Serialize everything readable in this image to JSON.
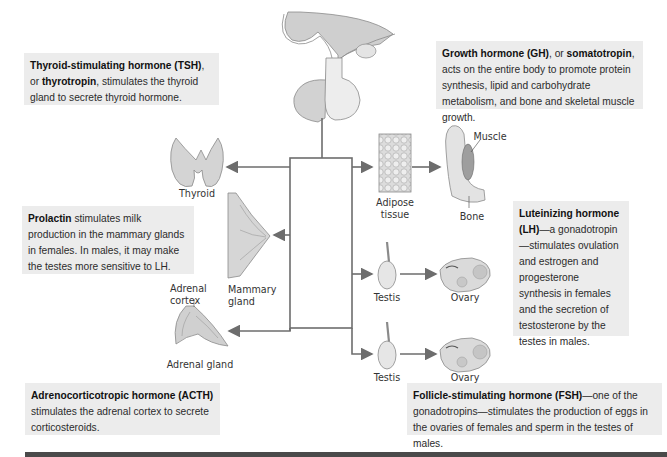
{
  "boxes": {
    "tsh": {
      "bold1": "Thyroid-stimulating hormone (TSH)",
      "text1": ", or ",
      "bold2": "thyrotropin",
      "text2": ", stimulates the thyroid gland to secrete thyroid hormone."
    },
    "gh": {
      "bold1": "Growth hormone (GH)",
      "text1": ", or ",
      "bold2": "somatotropin",
      "text2": ", acts on the entire body to promote protein synthesis, lipid and carbohydrate metabolism, and bone and skeletal muscle growth."
    },
    "prolactin": {
      "bold1": "Prolactin",
      "text1": " stimulates milk production in the mammary glands in females. In males, it may make the testes more sensitive to LH."
    },
    "lh": {
      "bold1": "Luteinizing hormone (LH)",
      "text1": "—a gonadotropin—stimulates ovulation and estrogen and progesterone synthesis in females and the secretion of testosterone by the testes in males."
    },
    "acth": {
      "bold1": "Adrenocorticotropic hormone (ACTH)",
      "text1": " stimulates the adrenal cortex to secrete corticosteroids."
    },
    "fsh": {
      "bold1": "Follicle-stimulating hormone (FSH)",
      "text1": "—one of the gonadotropins—stimulates the production of eggs in the ovaries of females and sperm in the testes of males."
    }
  },
  "labels": {
    "thyroid": "Thyroid",
    "mammary_line1": "Mammary",
    "mammary_line2": "gland",
    "adrenal_cortex_line1": "Adrenal",
    "adrenal_cortex_line2": "cortex",
    "adrenal_gland": "Adrenal gland",
    "adipose_line1": "Adipose",
    "adipose_line2": "tissue",
    "muscle": "Muscle",
    "bone": "Bone",
    "testis_lh": "Testis",
    "ovary_lh": "Ovary",
    "testis_fsh": "Testis",
    "ovary_fsh": "Ovary"
  },
  "colors": {
    "box_bg": "#ececec",
    "arrow": "#6d6d6d",
    "organ_fill": "#d8d8d8",
    "bottom_bar": "#4a4a4a"
  }
}
